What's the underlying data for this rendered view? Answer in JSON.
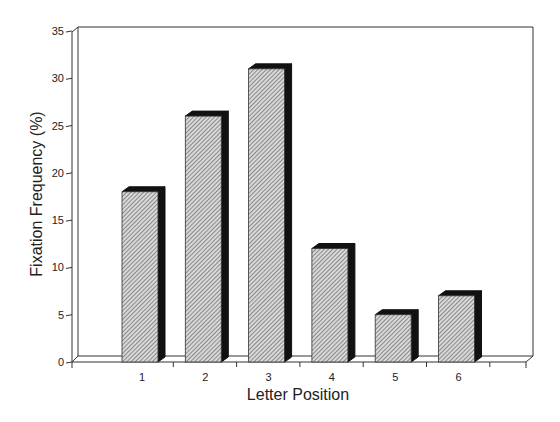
{
  "chart_data": {
    "type": "bar",
    "title": "",
    "xlabel": "Letter Position",
    "ylabel": "Fixation Frequency (%)",
    "categories": [
      "1",
      "2",
      "3",
      "4",
      "5",
      "6"
    ],
    "values": [
      18,
      26,
      31,
      12,
      5,
      7
    ],
    "ylim": [
      0,
      35
    ],
    "yticks": [
      "0",
      "5",
      "10",
      "15",
      "20",
      "25",
      "30",
      "35"
    ],
    "grid": false,
    "legend": null,
    "style": "3d-hatched"
  }
}
